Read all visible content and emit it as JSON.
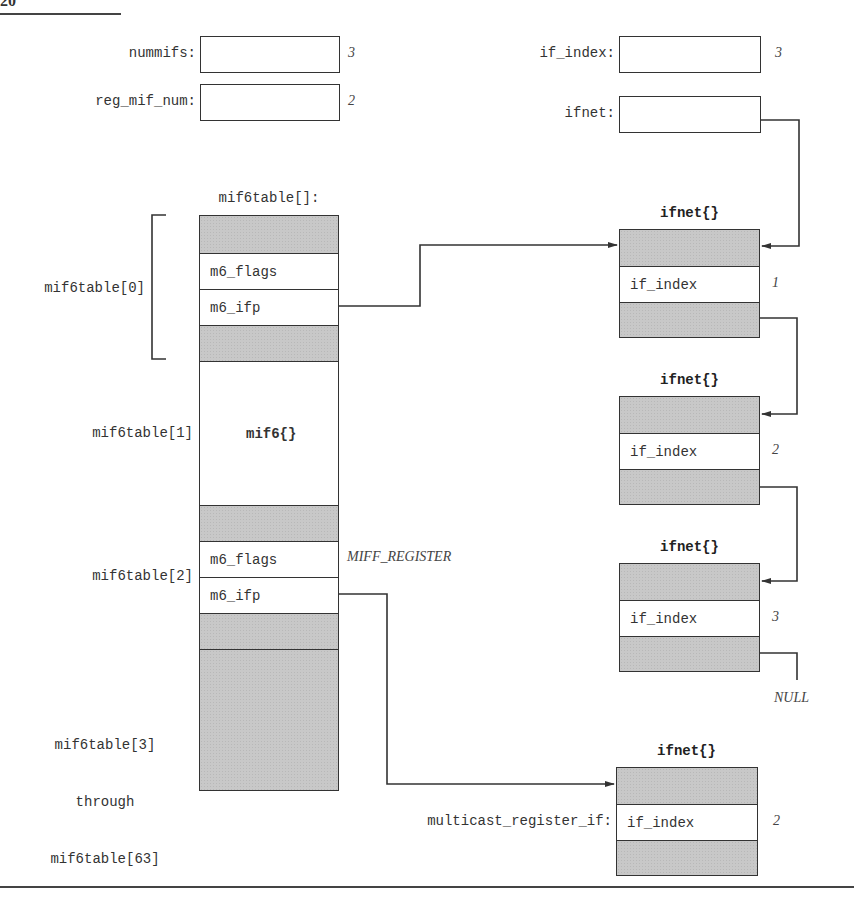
{
  "page": {
    "page_number_fragment": "20"
  },
  "globals": {
    "nummifs": {
      "label": "nummifs:",
      "value": "3"
    },
    "reg_mif_num": {
      "label": "reg_mif_num:",
      "value": "2"
    },
    "if_index": {
      "label": "if_index:",
      "value": "3"
    },
    "ifnet": {
      "label": "ifnet:"
    }
  },
  "mif6table": {
    "title": "mif6table[]:",
    "entries": [
      {
        "label": "mif6table[0]",
        "fields": [
          "",
          "m6_flags",
          "m6_ifp",
          ""
        ]
      },
      {
        "label": "mif6table[1]",
        "struct_label": "mif6{}"
      },
      {
        "label": "mif6table[2]",
        "fields": [
          "",
          "m6_flags",
          "m6_ifp",
          ""
        ],
        "flags_value": "MIFF_REGISTER"
      },
      {
        "label_lines": [
          "mif6table[3]",
          "through",
          "mif6table[63]"
        ]
      }
    ]
  },
  "ifnet_list": [
    {
      "title": "ifnet{}",
      "field": "if_index",
      "value": "1"
    },
    {
      "title": "ifnet{}",
      "field": "if_index",
      "value": "2"
    },
    {
      "title": "ifnet{}",
      "field": "if_index",
      "value": "3"
    }
  ],
  "null_label": "NULL",
  "register_if": {
    "title": "ifnet{}",
    "label": "multicast_register_if:",
    "field": "if_index",
    "value": "2"
  },
  "colors": {
    "line": "#333333",
    "shade": "#c8c8c8",
    "background": "#ffffff"
  }
}
